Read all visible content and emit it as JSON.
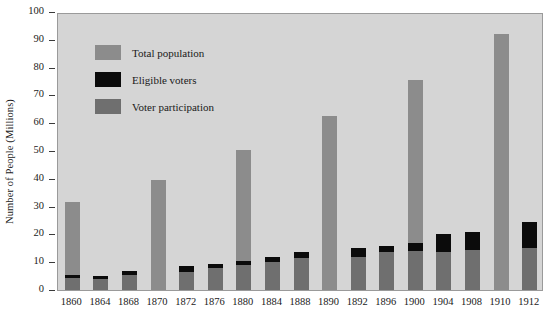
{
  "chart_data": {
    "type": "bar",
    "title": "",
    "subtitle": "",
    "xlabel": "",
    "ylabel": "Number of People (Millions)",
    "ylim": [
      0,
      100
    ],
    "y_ticks": [
      0,
      10,
      20,
      30,
      40,
      50,
      60,
      70,
      80,
      90,
      100
    ],
    "grid": false,
    "legend_position": "inside-top-left",
    "stacked_overlay": true,
    "categories": [
      "1860",
      "1864",
      "1868",
      "1870",
      "1872",
      "1876",
      "1880",
      "1884",
      "1888",
      "1890",
      "1892",
      "1896",
      "1900",
      "1904",
      "1908",
      "1910",
      "1912"
    ],
    "series": [
      {
        "name": "Total population",
        "color": "#8c8c8c",
        "values": [
          31.5,
          5,
          7,
          39.5,
          8.5,
          9.5,
          50.5,
          12,
          13.5,
          62.5,
          15,
          16,
          75.5,
          20,
          21,
          92,
          24.5
        ]
      },
      {
        "name": "Eligible voters",
        "color": "#0b0b0b",
        "values": [
          5.5,
          5,
          7,
          0,
          8.5,
          9.5,
          10.5,
          12,
          13.5,
          0,
          15,
          16,
          17,
          20,
          21,
          0,
          24.5
        ]
      },
      {
        "name": "Voter participation",
        "color": "#6f6f6f",
        "values": [
          4.5,
          4,
          5.5,
          0,
          6.5,
          8,
          9,
          10,
          11.5,
          0,
          12,
          13.5,
          14,
          13.5,
          14.5,
          0,
          15
        ]
      }
    ]
  },
  "legend": {
    "items": [
      {
        "label": "Total population",
        "swatch": "sw-total"
      },
      {
        "label": "Eligible voters",
        "swatch": "sw-eligible"
      },
      {
        "label": "Voter participation",
        "swatch": "sw-part"
      }
    ]
  },
  "axes": {
    "y_title": "Number of People (Millions)"
  }
}
